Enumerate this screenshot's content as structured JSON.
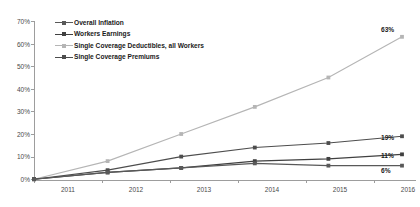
{
  "chart_data": {
    "type": "line",
    "title": "",
    "subtitle": "",
    "xlabel": "",
    "ylabel": "",
    "categories": [
      "2011",
      "2012",
      "2013",
      "2014",
      "2015",
      "2016"
    ],
    "x": [
      2011,
      2012,
      2013,
      2014,
      2015,
      2016
    ],
    "ylim": [
      0,
      70
    ],
    "xlim": [
      2011,
      2016
    ],
    "grid": false,
    "legend_position": "top-left",
    "y_ticks": [
      0,
      10,
      20,
      30,
      40,
      50,
      60,
      70
    ],
    "y_tick_labels": [
      "0%",
      "10%",
      "20%",
      "30%",
      "40%",
      "50%",
      "60%",
      "70%"
    ],
    "x_tick_labels": [
      "2011",
      "2012",
      "2013",
      "2014",
      "2015",
      "2016"
    ],
    "series": [
      {
        "name": "Overall Inflation",
        "color": "#595959",
        "values": [
          0,
          3,
          5,
          7,
          6,
          6
        ],
        "end_label": "6%"
      },
      {
        "name": "Workers Earnings",
        "color": "#404040",
        "values": [
          0,
          3,
          5,
          8,
          9,
          11
        ],
        "end_label": "11%"
      },
      {
        "name": "Single Coverage Deductibles, all Workers",
        "color": "#b5b5b5",
        "values": [
          0,
          8,
          20,
          32,
          45,
          63
        ],
        "end_label": "63%"
      },
      {
        "name": "Single Coverage Premiums",
        "color": "#4d4d4d",
        "values": [
          0,
          4,
          10,
          14,
          16,
          19
        ],
        "end_label": "19%"
      }
    ]
  },
  "legend": {
    "items": [
      {
        "label": "Overall Inflation"
      },
      {
        "label": "Workers Earnings"
      },
      {
        "label": "Single Coverage Deductibles, all Workers"
      },
      {
        "label": "Single Coverage Premiums"
      }
    ]
  },
  "axis": {
    "y_labels": [
      "70%",
      "60%",
      "50%",
      "40%",
      "30%",
      "20%",
      "10%",
      "0%"
    ],
    "x_labels": [
      "2011",
      "2012",
      "2013",
      "2014",
      "2015",
      "2016"
    ]
  },
  "end_labels": {
    "deductibles": "63%",
    "premiums": "19%",
    "earnings": "11%",
    "inflation": "6%"
  }
}
